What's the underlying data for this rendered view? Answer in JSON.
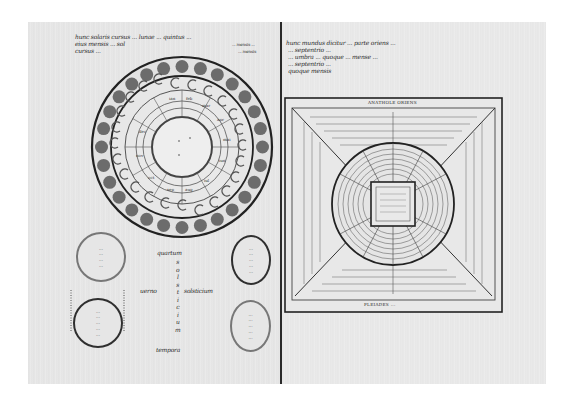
{
  "image": {
    "type": "medieval manuscript facsimile, two-page spread",
    "background": "#ffffff",
    "parchment_color": "#e6e6e6",
    "ink_color": "#2b2b2b"
  },
  "left_page": {
    "heading_lines": [
      "hunc solaris cursus ... lunae ... quintus ...",
      "eius mensis ... sol",
      "cursus ..."
    ],
    "heading_right_lines": [
      "... mensis ...",
      "... mensis"
    ],
    "diagram": {
      "name": "lunar phases wheel",
      "outer_ring": "moon discs",
      "middle_ring": "crescent phases",
      "inner_ring": "month names"
    },
    "roundels": [
      {
        "lines": [
          "... ",
          "... ",
          "...",
          "..."
        ]
      },
      {
        "lines": [
          "... ",
          "...",
          "...",
          "...",
          "..."
        ]
      },
      {
        "lines": [
          "... ",
          "...",
          "...",
          "...",
          "..."
        ]
      },
      {
        "lines": [
          "...",
          "...",
          "...",
          "...",
          "..."
        ]
      }
    ],
    "labels": {
      "top": "quartum",
      "vertical": [
        "s",
        "o",
        "l",
        "s",
        "t",
        "i",
        "c",
        "i",
        "u",
        "m"
      ],
      "left": "uerno",
      "right": "solsticium",
      "bottom": "tempora"
    }
  },
  "right_page": {
    "heading_lines": [
      "hunc mundus dicitur ... parte oriens ... ",
      "... septentrio ... ",
      "... umbra ... quoque ... mense ... ",
      "... septentrio ... ",
      "quoque mensis"
    ],
    "diagram": {
      "name": "square cosmological diagram",
      "top_label": "ANATHOLE ORIENS",
      "bottom_label": "PLEIADES ... ",
      "center": "concentric circle with inscribed square"
    }
  }
}
